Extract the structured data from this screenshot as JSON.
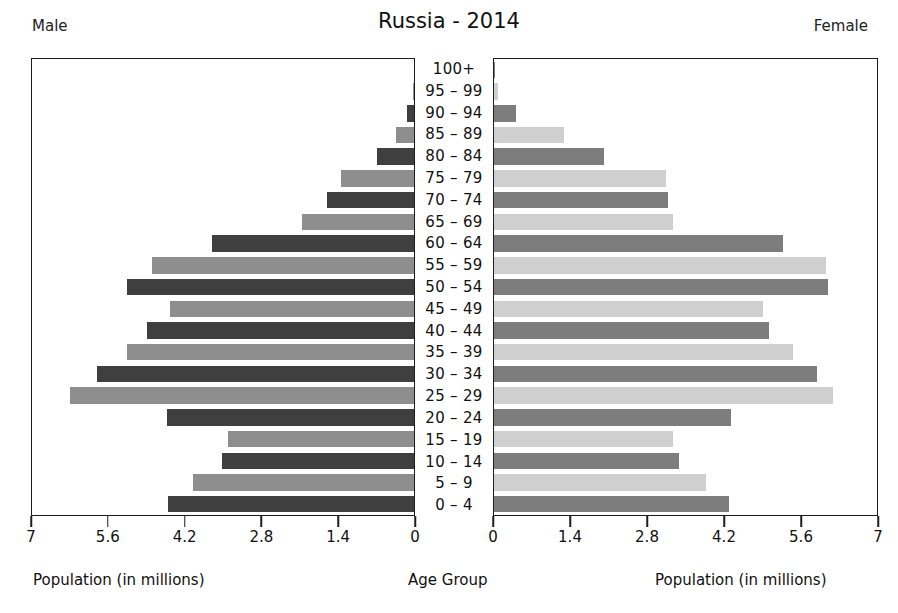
{
  "header": {
    "title": "Russia - 2014",
    "left_label": "Male",
    "right_label": "Female"
  },
  "captions": {
    "left": "Population (in millions)",
    "center": "Age Group",
    "right": "Population (in millions)"
  },
  "axis": {
    "left_ticks": [
      "7",
      "5.6",
      "4.2",
      "2.8",
      "1.4",
      "0"
    ],
    "right_ticks": [
      "0",
      "1.4",
      "2.8",
      "4.2",
      "5.6",
      "7"
    ],
    "max": 7,
    "tick_step": 1.4
  },
  "colors": {
    "male_dark": "#3f3f3f",
    "male_light": "#8e8e8e",
    "female_dark": "#7d7d7d",
    "female_light": "#cfcfcf",
    "frame": "#1c1c1c",
    "text": "#111111",
    "background": "#ffffff"
  },
  "chart_data": {
    "type": "bar",
    "title": "Russia - 2014",
    "subtitle": "",
    "orientation": "horizontal",
    "layout": "population-pyramid",
    "xlabel": "Population (in millions)",
    "ylabel": "Age Group",
    "xlim": [
      0,
      7
    ],
    "grid": false,
    "legend": "none",
    "categories": [
      "100+",
      "95 – 99",
      "90 – 94",
      "85 – 89",
      "80 – 84",
      "75 – 79",
      "70 – 74",
      "65 – 69",
      "60 – 64",
      "55 – 59",
      "50 – 54",
      "45 – 49",
      "40 – 44",
      "35 – 39",
      "30 – 34",
      "25 – 29",
      "20 – 24",
      "15 – 19",
      "10 – 14",
      "5 – 9",
      "0 – 4"
    ],
    "series": [
      {
        "name": "Male",
        "side": "left",
        "values": [
          0.0,
          0.02,
          0.13,
          0.33,
          0.68,
          1.33,
          1.59,
          2.05,
          3.71,
          4.8,
          5.26,
          4.47,
          4.89,
          5.26,
          5.81,
          6.3,
          4.53,
          3.41,
          3.52,
          4.05,
          4.51
        ]
      },
      {
        "name": "Female",
        "side": "right",
        "values": [
          0.01,
          0.08,
          0.4,
          1.28,
          2.01,
          3.14,
          3.18,
          3.27,
          5.29,
          6.06,
          6.1,
          4.91,
          5.02,
          5.47,
          5.91,
          6.2,
          4.33,
          3.27,
          3.38,
          3.87,
          4.29
        ]
      }
    ]
  }
}
